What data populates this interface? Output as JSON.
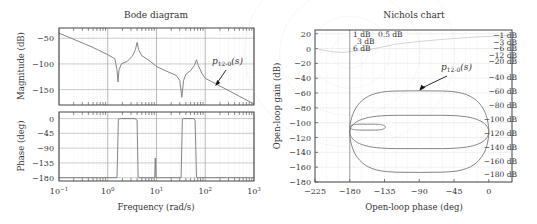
{
  "chart_data": [
    {
      "type": "line",
      "title": "Bode diagram",
      "xlabel": "Frequency (rad/s)",
      "xscale": "log",
      "xlim": [
        0.1,
        1000
      ],
      "xticks": [
        0.1,
        1,
        10,
        100,
        1000
      ],
      "xtick_labels": [
        {
          "base": "10",
          "exp": "−1"
        },
        {
          "base": "10",
          "exp": "0"
        },
        {
          "base": "10",
          "exp": "1"
        },
        {
          "base": "10",
          "exp": "2"
        },
        {
          "base": "10",
          "exp": "3"
        }
      ],
      "grid": true,
      "panels": [
        {
          "name": "magnitude",
          "ylabel": "Magnitude (dB)",
          "ylim": [
            -180,
            -30
          ],
          "yticks": [
            -50,
            -100,
            -150
          ],
          "ytick_labels": [
            "−50",
            "−100",
            "−150"
          ],
          "series": [
            {
              "name": "P12-0(s)",
              "points": [
                [
                  0.1,
                  -40
                ],
                [
                  0.5,
                  -68
                ],
                [
                  1.0,
                  -82
                ],
                [
                  1.4,
                  -90
                ],
                [
                  1.55,
                  -112
                ],
                [
                  1.62,
                  -135
                ],
                [
                  1.7,
                  -112
                ],
                [
                  1.9,
                  -100
                ],
                [
                  2.5,
                  -95
                ],
                [
                  3.2,
                  -85
                ],
                [
                  3.7,
                  -72
                ],
                [
                  4.0,
                  -58
                ],
                [
                  4.3,
                  -72
                ],
                [
                  5,
                  -84
                ],
                [
                  7,
                  -93
                ],
                [
                  9.5,
                  -103
                ],
                [
                  10,
                  -105
                ],
                [
                  15,
                  -113
                ],
                [
                  25,
                  -122
                ],
                [
                  30,
                  -132
                ],
                [
                  33,
                  -165
                ],
                [
                  36,
                  -132
                ],
                [
                  40,
                  -120
                ],
                [
                  50,
                  -113
                ],
                [
                  60,
                  -103
                ],
                [
                  66,
                  -92
                ],
                [
                  72,
                  -103
                ],
                [
                  85,
                  -118
                ],
                [
                  100,
                  -128
                ],
                [
                  200,
                  -143
                ],
                [
                  1000,
                  -178
                ]
              ]
            }
          ],
          "annotation": {
            "text": "p",
            "sub": "12-0",
            "suffix": "(s)",
            "arrow_to": [
              160,
              -143
            ]
          }
        },
        {
          "name": "phase",
          "ylabel": "Phase (deg)",
          "ylim": [
            -190,
            20
          ],
          "yticks": [
            0,
            -45,
            -90,
            -135,
            -180
          ],
          "ytick_labels": [
            "0",
            "−45",
            "−90",
            "−135",
            "−180"
          ],
          "series": [
            {
              "name": "P12-0(s) phase",
              "points": [
                [
                  0.1,
                  -180
                ],
                [
                  1.55,
                  -180
                ],
                [
                  1.65,
                  -2
                ],
                [
                  1.8,
                  0
                ],
                [
                  3.6,
                  0
                ],
                [
                  4.0,
                  -5
                ],
                [
                  4.2,
                  -178
                ],
                [
                  4.4,
                  -180
                ],
                [
                  9.2,
                  -180
                ],
                [
                  9.45,
                  -120
                ],
                [
                  9.7,
                  -180
                ],
                [
                  32,
                  -180
                ],
                [
                  34,
                  -2
                ],
                [
                  36,
                  0
                ],
                [
                  58,
                  0
                ],
                [
                  62,
                  -5
                ],
                [
                  66,
                  -178
                ],
                [
                  70,
                  -180
                ],
                [
                  1000,
                  -180
                ]
              ]
            }
          ]
        }
      ]
    },
    {
      "type": "line",
      "title": "Nichols chart",
      "xlabel": "Open-loop phase (deg)",
      "ylabel": "Open-loop gain (dB)",
      "xlim": [
        -225,
        30
      ],
      "ylim": [
        -180,
        25
      ],
      "xticks": [
        -225,
        -180,
        -135,
        -90,
        -45,
        0
      ],
      "xtick_labels": [
        "−225",
        "−180",
        "−135",
        "−90",
        "−45",
        "0"
      ],
      "yticks": [
        20,
        0,
        -20,
        -40,
        -60,
        -80,
        -100,
        -120,
        -140,
        -160,
        -180
      ],
      "ytick_labels": [
        "20",
        "0",
        "−20",
        "−40",
        "−60",
        "−80",
        "−100",
        "−120",
        "−140",
        "−160",
        "−180"
      ],
      "grid": true,
      "m_circle_labels_top": [
        "1 dB",
        "0.5 dB",
        "3 dB",
        "6 dB"
      ],
      "m_circle_labels_right": [
        "−1 dB",
        "−3 dB",
        "−6 dB",
        "−12 dB",
        "−20 dB",
        "−40 dB",
        "−60 dB",
        "−80 dB",
        "−100 dB",
        "−120 dB",
        "−140 dB",
        "−160 dB",
        "−180 dB"
      ],
      "series": [
        {
          "name": "P12-0(s) outer loop",
          "center": [
            -90,
            -112
          ],
          "phase_halfwidth": 90,
          "gain_top": -57,
          "gain_bottom": -167
        },
        {
          "name": "P12-0(s) middle loop",
          "center": [
            -90,
            -113
          ],
          "phase_halfwidth": 90,
          "gain_top": -90,
          "gain_bottom": -135
        },
        {
          "name": "P12-0(s) small loop",
          "center": [
            -157,
            -106
          ],
          "phase_halfwidth": 23,
          "gain_top": -102,
          "gain_bottom": -110
        }
      ],
      "annotation": {
        "text": "p",
        "sub": "12-0",
        "suffix": "(s)",
        "arrow_to": [
          -90,
          -57
        ]
      }
    }
  ]
}
